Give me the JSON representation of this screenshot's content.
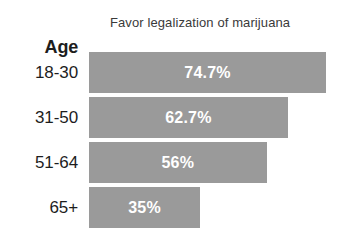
{
  "chart_data": {
    "type": "bar",
    "orientation": "horizontal",
    "title": "Favor legalization of marijuana",
    "xlabel": "",
    "ylabel": "Age",
    "categories": [
      "18-30",
      "31-50",
      "51-64",
      "65+"
    ],
    "values": [
      74.7,
      62.7,
      56,
      35
    ],
    "value_labels": [
      "74.7%",
      "62.7%",
      "56%",
      "35%"
    ],
    "xlim": [
      0,
      100
    ],
    "grid": false,
    "legend": null,
    "bar_color": "#9a9a9a",
    "value_label_color": "#ffffff",
    "text_color": "#1d1d1d",
    "background_color": "#ffffff"
  },
  "axis": {
    "header": "Age"
  }
}
